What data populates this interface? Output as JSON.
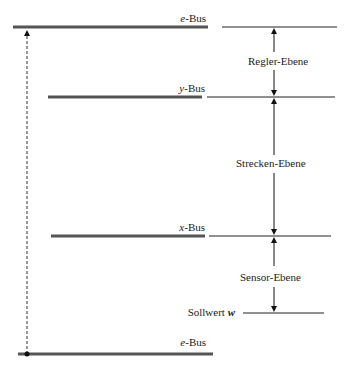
{
  "diagram": {
    "buses": [
      {
        "id": "e-bus-top",
        "var": "e",
        "suffix": "-Bus",
        "y": 27,
        "x1": 13,
        "x2": 208
      },
      {
        "id": "y-bus",
        "var": "y",
        "suffix": "-Bus",
        "y": 97,
        "x1": 48,
        "x2": 202
      },
      {
        "id": "x-bus",
        "var": "x",
        "suffix": "-Bus",
        "y": 236,
        "x1": 51,
        "x2": 205
      },
      {
        "id": "e-bus-bottom",
        "var": "e",
        "suffix": "-Bus",
        "y": 354,
        "x1": 18,
        "x2": 213
      }
    ],
    "levels": [
      {
        "label": "Regler-Ebene"
      },
      {
        "label": "Strecken-Ebene"
      },
      {
        "label": "Sensor-Ebene"
      }
    ],
    "setpoint": {
      "text": "Sollwert",
      "var": "w"
    },
    "colors": {
      "bus": "#555555",
      "line": "#222222",
      "background": "#ffffff"
    }
  }
}
